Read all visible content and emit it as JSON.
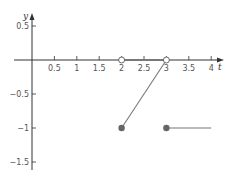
{
  "chart_data": {
    "type": "line",
    "title": "",
    "xlabel": "t",
    "ylabel": "y",
    "xlim": [
      -0.7,
      4.3
    ],
    "ylim": [
      -1.7,
      0.75
    ],
    "grid": false,
    "legend": null,
    "x_ticks": [
      0.5,
      1,
      1.5,
      2,
      2.5,
      3,
      3.5,
      4
    ],
    "x_tick_labels": [
      "0.5",
      "1",
      "1.5",
      "2",
      "2.5",
      "3",
      "3.5",
      "4"
    ],
    "y_ticks": [
      0.5,
      -0.5,
      -1,
      -1.5
    ],
    "y_tick_labels": [
      "0.5",
      "-0.5",
      "-1",
      "-1.5"
    ],
    "series": [
      {
        "name": "segment-zero",
        "points": [
          [
            2,
            0
          ],
          [
            3,
            0
          ]
        ],
        "style": "line"
      },
      {
        "name": "segment-ramp",
        "points": [
          [
            2,
            -1
          ],
          [
            3,
            0
          ]
        ],
        "style": "line"
      },
      {
        "name": "segment-flat",
        "points": [
          [
            3,
            -1
          ],
          [
            4,
            -1
          ]
        ],
        "style": "line"
      }
    ],
    "markers": [
      {
        "x": 2,
        "y": 0,
        "type": "open"
      },
      {
        "x": 3,
        "y": 0,
        "type": "open"
      },
      {
        "x": 2,
        "y": -1,
        "type": "closed"
      },
      {
        "x": 3,
        "y": -1,
        "type": "closed"
      }
    ],
    "colors": {
      "axis": "#333333",
      "line": "#777777",
      "marker_fill": "#666666"
    }
  }
}
